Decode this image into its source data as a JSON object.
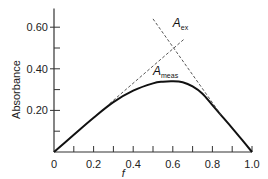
{
  "chart_data": {
    "type": "line",
    "title": "",
    "xlabel": "f",
    "ylabel": "Absorbance",
    "xlim": [
      0,
      1.0
    ],
    "ylim": [
      0,
      0.69
    ],
    "grid": false,
    "x_ticks": [
      0,
      0.2,
      0.4,
      0.6,
      0.8,
      1.0
    ],
    "x_tick_labels": [
      "0",
      "0.2",
      "0.4",
      "0.6",
      "0.8",
      "1.0"
    ],
    "x_minor_ticks": [
      0.1,
      0.3,
      0.5,
      0.7,
      0.9
    ],
    "y_ticks": [
      0.2,
      0.4,
      0.6
    ],
    "y_tick_labels": [
      "0.20",
      "0.40",
      "0.60"
    ],
    "y_minor_ticks": [
      0.1,
      0.3,
      0.5
    ],
    "series": [
      {
        "name": "A_meas",
        "style": "solid",
        "x": [
          0,
          0.1,
          0.2,
          0.3,
          0.4,
          0.5,
          0.55,
          0.6,
          0.65,
          0.7,
          0.75,
          0.8,
          0.85,
          0.9,
          0.95,
          1.0
        ],
        "y": [
          0,
          0.083,
          0.165,
          0.24,
          0.295,
          0.33,
          0.338,
          0.34,
          0.335,
          0.315,
          0.28,
          0.225,
          0.17,
          0.115,
          0.058,
          0
        ]
      },
      {
        "name": "extrapolation-left",
        "style": "dashed",
        "x": [
          0.28,
          0.66
        ],
        "y": [
          0.232,
          0.545
        ]
      },
      {
        "name": "extrapolation-right",
        "style": "dashed",
        "x": [
          0.5,
          0.85
        ],
        "y": [
          0.64,
          0.17
        ]
      }
    ],
    "annotations": [
      {
        "main": "A",
        "sub": "ex",
        "x": 0.6,
        "y": 0.6
      },
      {
        "main": "A",
        "sub": "meas",
        "x": 0.5,
        "y": 0.37
      }
    ]
  }
}
